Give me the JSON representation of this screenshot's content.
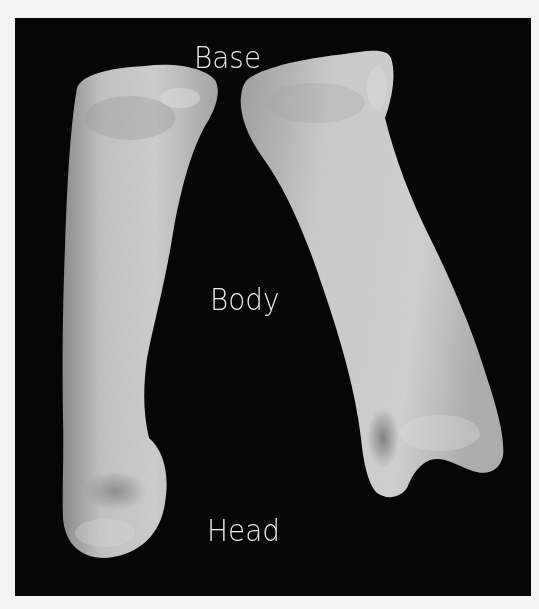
{
  "figure": {
    "background_color": "#060606",
    "bone_color": "#c8c8c8",
    "labels": [
      {
        "text": "Base",
        "x": 179,
        "y": 24
      },
      {
        "text": "Body",
        "x": 195,
        "y": 266
      },
      {
        "text": "Head",
        "x": 192,
        "y": 497
      }
    ]
  }
}
